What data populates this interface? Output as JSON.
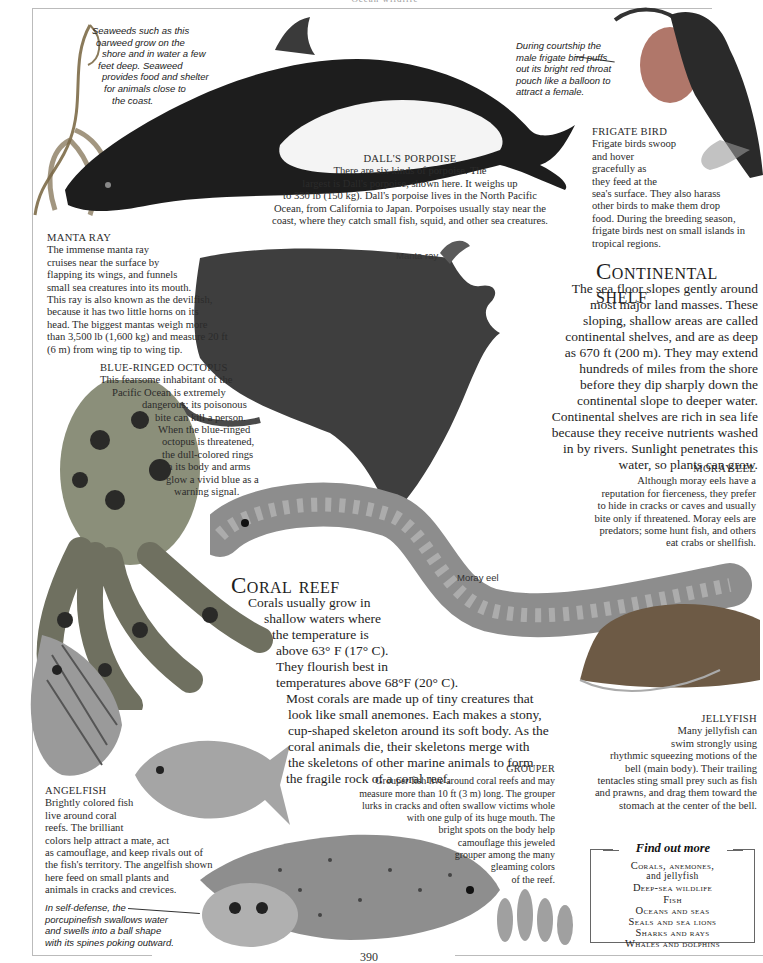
{
  "page": {
    "running_head": "Ocean wildlife",
    "page_number": "390"
  },
  "captions": {
    "seaweed": [
      "Seaweeds such as this",
      "oarweed grow on the",
      "shore and in water a few",
      "feet deep. Seaweed",
      "provides food and shelter",
      "for animals close to",
      "the coast."
    ],
    "frigate_courtship": [
      "During courtship the",
      "male frigate bird puffs",
      "out its bright red throat",
      "pouch like a balloon to",
      "attract a female."
    ],
    "porcupinefish": [
      "In self-defense, the",
      "porcupinefish swallows water",
      "and swells into a ball shape",
      "with its spines poking outward."
    ]
  },
  "labels": {
    "manta": "Manta ray",
    "moray": "Moray eel"
  },
  "entries": {
    "porpoise": {
      "title": "Dall's porpoise",
      "lines": [
        "There are six kinds of porpoise. The",
        "largest is Dall's porpoise, shown here. It weighs up",
        "to 330 lb (150 kg). Dall's porpoise lives in the North Pacific",
        "Ocean, from California to Japan. Porpoises usually stay near the",
        "coast, where they catch small fish, squid, and other sea creatures."
      ]
    },
    "frigate": {
      "title": "Frigate bird",
      "lines": [
        "Frigate birds swoop",
        "and hover",
        "gracefully as",
        "they feed at the",
        "sea's surface. They also harass",
        "other birds to make them drop",
        "food. During the breeding season,",
        "frigate birds nest on small islands in",
        "tropical regions."
      ]
    },
    "manta": {
      "title": "Manta ray",
      "lines": [
        "The immense manta ray",
        "cruises near the surface by",
        "flapping its wings, and funnels",
        "small sea creatures into its mouth.",
        "This ray is also known as the devilfish,",
        "because it has two little horns on its",
        "head. The biggest mantas weigh more",
        "than 3,500 lb (1,600 kg) and measure 20 ft",
        "(6 m) from wing tip to wing tip."
      ]
    },
    "octopus": {
      "title": "Blue-ringed octopus",
      "lines": [
        "This fearsome inhabitant of the",
        "Pacific Ocean is extremely",
        "dangerous; its poisonous",
        "bite can kill a person.",
        "When the blue-ringed",
        "octopus is threatened,",
        "the dull-colored rings",
        "on its body and arms",
        "glow a vivid blue as a",
        "warning signal."
      ]
    },
    "moray": {
      "title": "Moray eel",
      "lines": [
        "Although moray eels have a",
        "reputation for fierceness, they prefer",
        "to hide in cracks or caves and usually",
        "bite only if threatened. Moray eels are",
        "predators; some hunt fish, and others",
        "eat crabs or shellfish."
      ]
    },
    "jellyfish": {
      "title": "Jellyfish",
      "lines": [
        "Many jellyfish can",
        "swim strongly using",
        "rhythmic squeezing motions of the",
        "bell (main body). Their trailing",
        "tentacles sting small prey such as fish",
        "and prawns, and drag them toward the",
        "stomach at the center of the bell."
      ]
    },
    "grouper": {
      "title": "Grouper",
      "lines": [
        "Grouper fish live around coral reefs and may",
        "measure more than 10 ft (3 m) long. The grouper",
        "lurks in cracks and often swallow victims whole",
        "with one gulp of its huge mouth. The",
        "bright spots on the body help",
        "camouflage this jeweled",
        "grouper among the many",
        "gleaming colors",
        "of the reef."
      ]
    },
    "angelfish": {
      "title": "Angelfish",
      "lines": [
        "Brightly colored fish",
        "live around coral",
        "reefs. The brilliant",
        "colors help attract a mate, act",
        "as camouflage, and keep rivals out of",
        "the fish's territory. The angelfish shown",
        "here feed on small plants and",
        "animals in cracks and crevices."
      ]
    }
  },
  "sections": {
    "continental_shelf": {
      "title": "Continental shelf",
      "lines": [
        "The sea floor slopes gently around",
        "most major land masses. These",
        "sloping, shallow areas are called",
        "continental shelves, and are as deep",
        "as 670 ft (200 m). They may extend",
        "hundreds of miles from the shore",
        "before they dip sharply down the",
        "continental slope to deeper water.",
        "Continental shelves are rich in sea life",
        "because they receive nutrients washed",
        "in by rivers. Sunlight penetrates this",
        "water, so plants can grow."
      ]
    },
    "coral_reef": {
      "title": "Coral reef",
      "lines": [
        "Corals usually grow in",
        "shallow waters where",
        "the temperature is",
        "above 63° F (17° C).",
        "They flourish best in",
        "temperatures above 68°F (20° C).",
        "Most corals are made up of tiny creatures that",
        "look like small anemones. Each makes a stony,",
        "cup-shaped skeleton around its soft body. As the",
        "coral animals die, their skeletons merge with",
        "the skeletons of other marine animals to form",
        "the fragile rock of a coral reef."
      ]
    }
  },
  "find_out_more": {
    "heading": "Find out more",
    "items": [
      "Corals, anemones,",
      "and jellyfish",
      "Deep-sea wildlife",
      "Fish",
      "Oceans and seas",
      "Seals and sea lions",
      "Sharks and rays",
      "Whales and dolphins"
    ]
  },
  "colors": {
    "ink": "#2a2a2a",
    "rule": "#bbbbbb",
    "illustration_dark": "#1c1c1c",
    "illustration_mid": "#6e6e6e",
    "illustration_light": "#c8c8c8"
  }
}
